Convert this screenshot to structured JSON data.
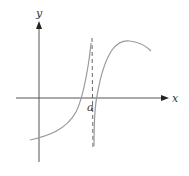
{
  "diagram": {
    "type": "function-graph",
    "axes": {
      "x_label": "x",
      "y_label": "y",
      "origin_px": [
        39,
        98
      ]
    },
    "asymptote": {
      "label": "a",
      "style": "dashed vertical line",
      "x_px": 92
    },
    "curves": [
      {
        "name": "left-branch",
        "description": "increasing curve crossing the x-axis left of a, rising to +infinity as x approaches a from the left"
      },
      {
        "name": "right-branch",
        "description": "curve rising from -infinity just right of a, crossing the x-axis, reaching a maximum, then decreasing"
      }
    ],
    "colors": {
      "axis": "#555555",
      "curve": "#999999",
      "asymptote": "#666666"
    }
  }
}
